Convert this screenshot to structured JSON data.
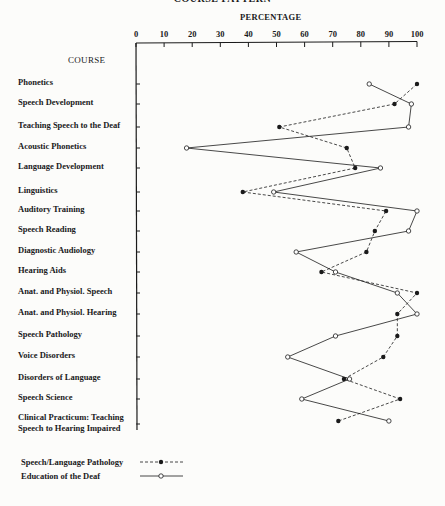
{
  "title": "COURSE PATTERN",
  "chart_data": {
    "type": "line",
    "orientation": "horizontal",
    "title": "COURSE PATTERN",
    "xlabel": "PERCENTAGE",
    "ylabel": "COURSE",
    "xlim": [
      0,
      100
    ],
    "x_ticks": [
      0,
      10,
      20,
      30,
      40,
      50,
      60,
      70,
      80,
      90,
      100
    ],
    "grid": false,
    "legend_position": "bottom-left",
    "categories": [
      "Phonetics",
      "Speech Development",
      "Teaching Speech to the Deaf",
      "Acoustic Phonetics",
      "Language Development",
      "Linguistics",
      "Auditory Training",
      "Speech Reading",
      "Diagnostic Audiology",
      "Hearing Aids",
      "Anat. and Physiol. Speech",
      "Anat. and Physiol. Hearing",
      "Speech Pathology",
      "Voice Disorders",
      "Disorders of Language",
      "Speech Science",
      "Clinical Practicum: Teaching Speech to Hearing Impaired"
    ],
    "series": [
      {
        "name": "Speech/Language Pathology",
        "style": "dashed-filled-circle",
        "values": [
          100,
          92,
          51,
          75,
          78,
          38,
          89,
          85,
          82,
          66,
          100,
          93,
          93,
          88,
          74,
          94,
          72
        ]
      },
      {
        "name": "Education of the Deaf",
        "style": "solid-open-circle",
        "values": [
          83,
          98,
          97,
          18,
          87,
          49,
          100,
          97,
          57,
          71,
          93,
          100,
          71,
          54,
          76,
          59,
          90
        ]
      }
    ]
  },
  "axis": {
    "percentage_label": "PERCENTAGE",
    "course_label": "COURSE",
    "ticks": [
      "0",
      "10",
      "20",
      "30",
      "40",
      "50",
      "60",
      "70",
      "80",
      "90",
      "100"
    ]
  },
  "courses": [
    {
      "label": "Phonetics"
    },
    {
      "label": "Speech Development"
    },
    {
      "label": "Teaching Speech to the Deaf"
    },
    {
      "label": "Acoustic Phonetics"
    },
    {
      "label": "Language Development"
    },
    {
      "label": "Linguistics"
    },
    {
      "label": "Auditory Training"
    },
    {
      "label": "Speech Reading"
    },
    {
      "label": "Diagnostic Audiology"
    },
    {
      "label": "Hearing Aids"
    },
    {
      "label": "Anat. and Physiol. Speech"
    },
    {
      "label": "Anat. and Physiol. Hearing"
    },
    {
      "label": "Speech Pathology"
    },
    {
      "label": "Voice Disorders"
    },
    {
      "label": "Disorders of Language"
    },
    {
      "label": "Speech Science"
    },
    {
      "label": "Clinical Practicum: Teaching",
      "label2": "Speech to Hearing Impaired"
    }
  ],
  "legend": [
    {
      "label": "Speech/Language Pathology"
    },
    {
      "label": "Education of the Deaf"
    }
  ],
  "colors": {
    "ink": "#1a1a1a",
    "paper": "#fcfcfa"
  }
}
